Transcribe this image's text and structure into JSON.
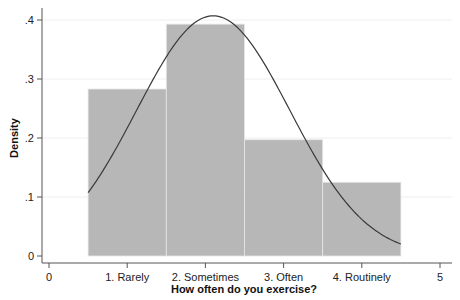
{
  "chart_data": {
    "type": "bar",
    "subtype": "histogram_with_normal_overlay",
    "title": "",
    "xlabel": "How often do you exercise?",
    "ylabel": "Density",
    "categories": [
      "1. Rarely",
      "2. Sometimes",
      "3. Often",
      "4. Routinely"
    ],
    "category_positions": [
      1,
      2,
      3,
      4
    ],
    "bin_width": 1,
    "values": [
      0.283,
      0.393,
      0.197,
      0.125
    ],
    "series": [
      {
        "name": "Density (histogram)",
        "values": [
          0.283,
          0.393,
          0.197,
          0.125
        ]
      },
      {
        "name": "Normal density",
        "type": "line",
        "mean": 2.1,
        "sd": 0.98,
        "x_range": [
          0.5,
          4.5
        ]
      }
    ],
    "xlim": [
      0,
      5
    ],
    "ylim": [
      0,
      0.4
    ],
    "x_ticks": [
      {
        "value": 0,
        "label": "0"
      },
      {
        "value": 1,
        "label": "1. Rarely"
      },
      {
        "value": 2,
        "label": "2. Sometimes"
      },
      {
        "value": 3,
        "label": "3. Often"
      },
      {
        "value": 4,
        "label": "4. Routinely"
      },
      {
        "value": 5,
        "label": "5"
      }
    ],
    "y_ticks": [
      {
        "value": 0,
        "label": "0"
      },
      {
        "value": 0.1,
        "label": ".1"
      },
      {
        "value": 0.2,
        "label": ".2"
      },
      {
        "value": 0.3,
        "label": ".3"
      },
      {
        "value": 0.4,
        "label": ".4"
      }
    ],
    "grid": "horizontal",
    "legend": "none",
    "colors": {
      "bar_fill": "#b7b7b7",
      "bar_edge": "#e6e6e6",
      "curve": "#3a3a3a",
      "axis": "#555555",
      "grid": "#eeeeee"
    }
  }
}
